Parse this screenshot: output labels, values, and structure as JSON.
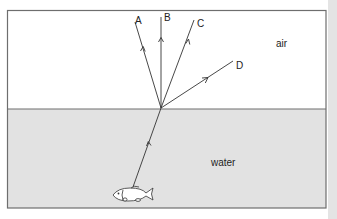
{
  "diagram": {
    "type": "refraction-diagram",
    "media": {
      "upper": {
        "label": "air",
        "color": "#ffffff"
      },
      "lower": {
        "label": "water",
        "color": "#e2e2e2"
      }
    },
    "rays": [
      {
        "label": "A"
      },
      {
        "label": "B"
      },
      {
        "label": "C"
      },
      {
        "label": "D"
      }
    ],
    "source": {
      "icon": "fish-icon"
    },
    "colors": {
      "border": "#6e6e6e",
      "line": "#333333",
      "side_strip": "#e4e4e4"
    }
  }
}
